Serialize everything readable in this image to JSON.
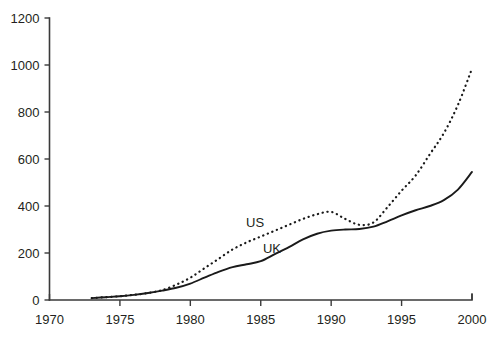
{
  "chart_data": {
    "type": "line",
    "title": "",
    "subtitle": "",
    "xlabel": "",
    "ylabel": "",
    "xlim": [
      1970,
      2000
    ],
    "ylim": [
      0,
      1200
    ],
    "grid": false,
    "legend_position": "inline-annotation",
    "x_ticks": [
      1970,
      1975,
      1980,
      1985,
      1990,
      1995,
      2000
    ],
    "x_tick_labels": [
      "1970",
      "1975",
      "1980",
      "1985",
      "1990",
      "1995",
      "2000"
    ],
    "y_ticks": [
      0,
      200,
      400,
      600,
      800,
      1000,
      1200
    ],
    "y_tick_labels": [
      "0",
      "200",
      "400",
      "600",
      "800",
      "1000",
      "1200"
    ],
    "annotations": [
      {
        "text": "US",
        "x": 1984.6,
        "y": 310
      },
      {
        "text": "UK",
        "x": 1985.8,
        "y": 200
      }
    ],
    "series": [
      {
        "name": "US",
        "style": "dotted",
        "color": "#1a1a1a",
        "x": [
          1973,
          1974,
          1975,
          1976,
          1977,
          1978,
          1979,
          1980,
          1981,
          1982,
          1983,
          1984,
          1985,
          1986,
          1987,
          1988,
          1989,
          1990,
          1991,
          1992,
          1993,
          1994,
          1995,
          1996,
          1997,
          1998,
          1999,
          2000
        ],
        "values": [
          8,
          12,
          16,
          22,
          30,
          42,
          65,
          95,
          135,
          175,
          215,
          245,
          270,
          295,
          320,
          345,
          365,
          375,
          345,
          320,
          330,
          395,
          465,
          530,
          620,
          710,
          830,
          985
        ]
      },
      {
        "name": "UK",
        "style": "solid",
        "color": "#1a1a1a",
        "x": [
          1973,
          1974,
          1975,
          1976,
          1977,
          1978,
          1979,
          1980,
          1981,
          1982,
          1983,
          1984,
          1985,
          1986,
          1987,
          1988,
          1989,
          1990,
          1991,
          1992,
          1993,
          1994,
          1995,
          1996,
          1997,
          1998,
          1999,
          2000
        ],
        "values": [
          8,
          12,
          16,
          22,
          30,
          40,
          52,
          70,
          95,
          120,
          140,
          152,
          165,
          195,
          225,
          258,
          282,
          295,
          300,
          302,
          312,
          335,
          360,
          382,
          400,
          425,
          470,
          545
        ]
      }
    ]
  },
  "axes": {
    "y_axis_name": "y-axis",
    "x_axis_name": "x-axis"
  }
}
